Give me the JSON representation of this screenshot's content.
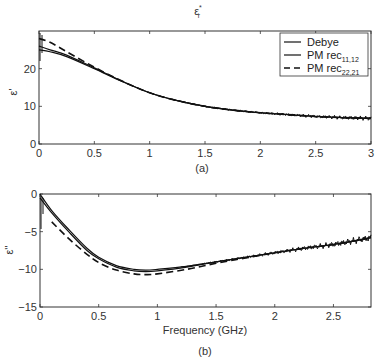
{
  "figure": {
    "title": "ε*r",
    "title_main": "ε",
    "title_sup": "*",
    "title_sub": "r"
  },
  "chart_data": [
    {
      "id": "a",
      "type": "line",
      "panel_label": "(a)",
      "title": "ε*r",
      "xlabel": "",
      "ylabel": "ε'",
      "xlim": [
        0,
        3
      ],
      "ylim": [
        0,
        30
      ],
      "xticks": [
        "0",
        "0.5",
        "1",
        "1.5",
        "2",
        "2.5",
        "3"
      ],
      "yticks": [
        "0",
        "10",
        "20"
      ],
      "grid": false,
      "legend_position": "upper right",
      "legend": [
        "Debye",
        "PM rec11,12",
        "PM rec22,21"
      ],
      "series": [
        {
          "name": "Debye",
          "style": "solid",
          "x": [
            0,
            0.1,
            0.25,
            0.5,
            0.75,
            1.0,
            1.25,
            1.5,
            1.75,
            2.0,
            2.25,
            2.5,
            2.75,
            3.0
          ],
          "y": [
            25,
            24.5,
            23.2,
            20.0,
            16.6,
            13.6,
            11.5,
            10.0,
            9.0,
            8.3,
            7.8,
            7.3,
            7.0,
            6.8
          ]
        },
        {
          "name": "PM rec11,12",
          "style": "solid",
          "x": [
            0,
            0.1,
            0.25,
            0.5,
            0.75,
            1.0,
            1.25,
            1.5,
            1.75,
            2.0,
            2.25,
            2.5,
            2.75,
            3.0
          ],
          "y": [
            26,
            25,
            23.6,
            20.2,
            16.7,
            13.6,
            11.5,
            10.0,
            9.0,
            8.3,
            7.8,
            7.3,
            7.0,
            6.8
          ]
        },
        {
          "name": "PM rec22,21",
          "style": "dashed",
          "x": [
            0,
            0.1,
            0.25,
            0.5,
            0.75,
            1.0,
            1.25,
            1.5,
            1.75,
            2.0,
            2.25,
            2.5,
            2.75,
            3.0
          ],
          "y": [
            28,
            27,
            24.5,
            20.4,
            16.7,
            13.6,
            11.5,
            10.0,
            9.0,
            8.3,
            7.8,
            7.3,
            7.0,
            6.8
          ]
        }
      ]
    },
    {
      "id": "b",
      "type": "line",
      "panel_label": "(b)",
      "title": "",
      "xlabel": "Frequency (GHz)",
      "ylabel": "ε''",
      "xlim": [
        0,
        2.82
      ],
      "ylim": [
        -15,
        0
      ],
      "xticks": [
        "0",
        "0.5",
        "1",
        "1.5",
        "2",
        "2.5"
      ],
      "yticks": [
        "0",
        "-5",
        "-10",
        "-15"
      ],
      "grid": false,
      "series": [
        {
          "name": "Debye",
          "style": "solid",
          "x": [
            0,
            0.1,
            0.25,
            0.4,
            0.5,
            0.65,
            0.8,
            0.9,
            1.0,
            1.25,
            1.5,
            1.75,
            2.0,
            2.25,
            2.5,
            2.82
          ],
          "y": [
            0,
            -2.2,
            -4.8,
            -7.2,
            -8.4,
            -9.5,
            -10.0,
            -10.1,
            -10.0,
            -9.6,
            -9.0,
            -8.4,
            -7.8,
            -7.2,
            -6.7,
            -5.8
          ]
        },
        {
          "name": "PM rec11,12",
          "style": "solid",
          "x": [
            0,
            0.1,
            0.25,
            0.4,
            0.5,
            0.65,
            0.8,
            0.9,
            1.0,
            1.25,
            1.5,
            1.75,
            2.0,
            2.25,
            2.5,
            2.82
          ],
          "y": [
            -0.5,
            -2.5,
            -5.1,
            -7.5,
            -8.6,
            -9.7,
            -10.2,
            -10.3,
            -10.2,
            -9.7,
            -9.0,
            -8.4,
            -7.8,
            -7.2,
            -6.7,
            -5.8
          ]
        },
        {
          "name": "PM rec22,21",
          "style": "dashed",
          "x": [
            0.1,
            0.25,
            0.4,
            0.5,
            0.65,
            0.8,
            0.9,
            1.0,
            1.25,
            1.5,
            1.75,
            2.0,
            2.25,
            2.5,
            2.82
          ],
          "y": [
            -3.7,
            -6.0,
            -8.0,
            -9.1,
            -10.1,
            -10.6,
            -10.7,
            -10.6,
            -10.0,
            -9.2,
            -8.5,
            -7.8,
            -7.2,
            -6.7,
            -5.8
          ]
        }
      ]
    }
  ]
}
